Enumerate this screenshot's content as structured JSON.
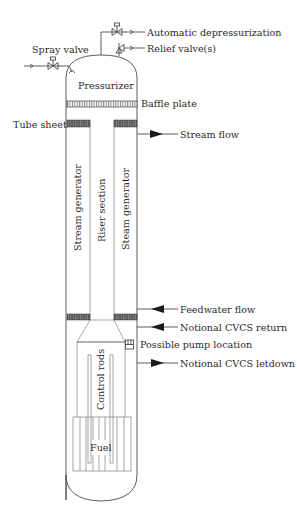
{
  "diagram": {
    "labels": {
      "spray_valve": "Spray valve",
      "automatic_depressurization": "Automatic depressurization",
      "relief_valves": "Relief valve(s)",
      "pressurizer": "Pressurizer",
      "baffle_plate": "Baffle plate",
      "tube_sheet": "Tube sheet",
      "stream_flow": "Stream flow",
      "stream_generator_left": "Stream generator",
      "riser_section": "Riser section",
      "steam_generator_right": "Steam generator",
      "feedwater_flow": "Feedwater flow",
      "notional_cvcs_return": "Notional CVCS return",
      "possible_pump_location": "Possible pump location",
      "notional_cvcs_letdown": "Notional CVCS letdown",
      "control_rods": "Control rods",
      "fuel": "Fuel"
    },
    "flows": [
      {
        "name": "stream-flow",
        "direction": "out"
      },
      {
        "name": "feedwater-flow",
        "direction": "in"
      },
      {
        "name": "notional-cvcs-return",
        "direction": "in"
      },
      {
        "name": "notional-cvcs-letdown",
        "direction": "out"
      }
    ],
    "colors": {
      "line": "#4a4a4a",
      "tube_sheet": "#555555",
      "text": "#2a2a2a",
      "background": "#ffffff"
    }
  }
}
